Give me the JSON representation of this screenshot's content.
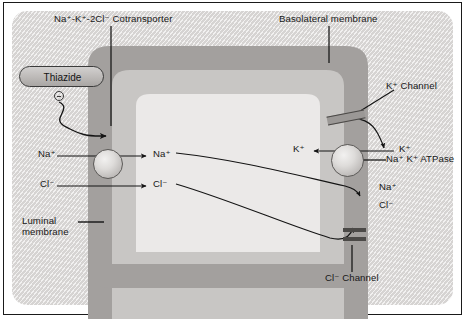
{
  "figure": {
    "background_color": "#e2e0df",
    "frame_color": "#1a1a1a"
  },
  "cell": {
    "outer_membrane_color": "#a3a09e",
    "mid_cytoplasm_color": "#c8c6c4",
    "inner_cytoplasm_color": "#ebe9e8"
  },
  "labels": {
    "cotransporter": "Na⁺-K⁺-2Cl⁻ Cotransporter",
    "basolateral_membrane": "Basolateral membrane",
    "luminal_membrane_line1": "Luminal",
    "luminal_membrane_line2": "membrane",
    "k_channel": "K⁺ Channel",
    "cl_channel": "Cl⁻ Channel",
    "na_k_atpase": "Na⁺ K⁺ ATPase"
  },
  "drug": {
    "name": "Thiazide",
    "effect_symbol": "⊖",
    "effect_meaning": "inhibition"
  },
  "ions": [
    {
      "id": "na-lumen-outside",
      "text": "Na⁺",
      "x": 38,
      "y": 148,
      "side": "lumen-outside"
    },
    {
      "id": "na-lumen-inside",
      "text": "Na⁺",
      "x": 153,
      "y": 148,
      "side": "cell-inside"
    },
    {
      "id": "cl-lumen-outside",
      "text": "Cl⁻",
      "x": 40,
      "y": 178,
      "side": "lumen-outside"
    },
    {
      "id": "cl-lumen-inside",
      "text": "Cl⁻",
      "x": 153,
      "y": 178,
      "side": "cell-inside"
    },
    {
      "id": "k-baso-inside",
      "text": "K⁺",
      "x": 293,
      "y": 143,
      "side": "cell-inside"
    },
    {
      "id": "k-baso-outside",
      "text": "K⁺",
      "x": 399,
      "y": 143,
      "side": "interstitium"
    },
    {
      "id": "na-baso-outside",
      "text": "Na⁺",
      "x": 379,
      "y": 181,
      "side": "interstitium"
    },
    {
      "id": "cl-baso-outside",
      "text": "Cl⁻",
      "x": 379,
      "y": 199,
      "side": "interstitium"
    }
  ],
  "transporters": [
    {
      "id": "cotransporter-sphere",
      "name": "Na-K-2Cl cotransporter",
      "shape": "sphere"
    },
    {
      "id": "atpase-sphere",
      "name": "Na+ K+ ATPase",
      "shape": "sphere"
    },
    {
      "id": "k-channel-bar",
      "name": "K+ channel",
      "shape": "bar"
    },
    {
      "id": "cl-channel-bar",
      "name": "Cl- channel",
      "shape": "bar"
    }
  ]
}
